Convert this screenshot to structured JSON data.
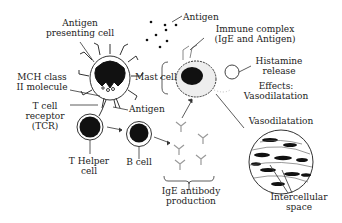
{
  "diagram": {
    "labels": {
      "apc": [
        "Antigen",
        "presenting cell"
      ],
      "mhc": [
        "MCH class",
        "II molecule"
      ],
      "tcr": [
        "T cell",
        "receptor",
        "(TCR)"
      ],
      "antigen_apc": "Antigen",
      "th": [
        "T Helper",
        "cell"
      ],
      "bcell": "B cell",
      "ige_prod": [
        "IgE antibody",
        "production"
      ],
      "antigen_top": "Antigen",
      "immune_complex": [
        "Immune complex",
        "(IgE and Antigen)"
      ],
      "mast": "Mast cell",
      "histamine": [
        "Histamine",
        "release"
      ],
      "effects": [
        "Effects:",
        "Vasodilatation"
      ],
      "vaso": "Vasodilatation",
      "intercellular": [
        "Intercellular",
        "space"
      ]
    },
    "colors": {
      "ink": "#222222",
      "nucleus": "#111111",
      "antibody": "#999999",
      "background": "#ffffff"
    }
  }
}
